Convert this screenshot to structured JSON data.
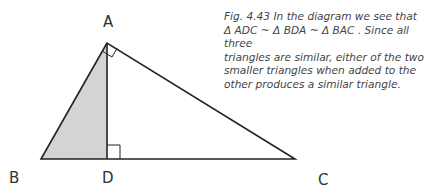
{
  "figure": {
    "labels": {
      "A": "A",
      "B": "B",
      "C": "C",
      "D": "D"
    },
    "caption_lines": [
      "Fig. 4.43  In the diagram we see that",
      "Δ ADC ~ Δ BDA ~ Δ BAC . Since all three",
      "triangles are similar, either of the two",
      "smaller triangles when added to the",
      "other produces a similar triangle."
    ],
    "colors": {
      "stroke": "#222222",
      "shade": "#d4d4d4"
    }
  }
}
